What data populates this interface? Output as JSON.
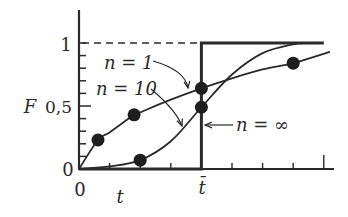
{
  "chart_data": {
    "type": "line",
    "title": "",
    "xlabel": "t",
    "ylabel": "F",
    "xlim": [
      0,
      8.3
    ],
    "ylim": [
      0,
      1.25
    ],
    "x_ticks": [
      1,
      2,
      3,
      4,
      5,
      6,
      7,
      8
    ],
    "x_tick_labels": [
      {
        "x": 0,
        "label": "0"
      },
      {
        "x": 4,
        "label": "t̄"
      }
    ],
    "y_ticks": [
      0,
      0.1,
      0.2,
      0.3,
      0.4,
      0.5,
      0.6,
      0.7,
      0.8,
      0.9,
      1.0
    ],
    "y_tick_labels": [
      {
        "y": 0,
        "label": "0"
      },
      {
        "y": 0.5,
        "label": "0,5"
      },
      {
        "y": 1,
        "label": "1"
      }
    ],
    "t_bar": 4,
    "reference_line": {
      "y": 1,
      "style": "dashed",
      "x_range": [
        0,
        4
      ]
    },
    "grid": false,
    "legend_position": "inline annotations",
    "series": [
      {
        "name": "n = 1",
        "x": [
          0,
          0.62,
          1,
          1.8,
          2,
          3,
          4,
          5,
          6,
          7,
          8.2
        ],
        "values": [
          0,
          0.23,
          0.29,
          0.43,
          0.45,
          0.55,
          0.64,
          0.72,
          0.79,
          0.84,
          0.93
        ],
        "markers": [
          {
            "x": 0.62,
            "y": 0.23
          },
          {
            "x": 1.8,
            "y": 0.43
          },
          {
            "x": 4,
            "y": 0.64
          },
          {
            "x": 7,
            "y": 0.84
          }
        ]
      },
      {
        "name": "n = 10",
        "x": [
          0,
          1,
          2,
          3,
          4,
          5,
          6,
          7,
          7.5
        ],
        "values": [
          0,
          0.02,
          0.07,
          0.22,
          0.49,
          0.75,
          0.92,
          0.99,
          1.0
        ],
        "markers": [
          {
            "x": 2,
            "y": 0.07
          },
          {
            "x": 4,
            "y": 0.49
          }
        ]
      },
      {
        "name": "n = ∞",
        "x": [
          0,
          4,
          4,
          8
        ],
        "values": [
          0,
          0,
          1,
          1
        ],
        "markers": []
      }
    ],
    "annotations": [
      {
        "text": "n = 1",
        "arrow_to": {
          "x": 3.6,
          "y": 0.62
        }
      },
      {
        "text": "n = 10",
        "arrow_to": {
          "x": 3.4,
          "y": 0.33
        }
      },
      {
        "text": "n = ∞",
        "arrow_to": {
          "x": 4,
          "y": 0.32
        }
      }
    ]
  },
  "labels": {
    "y_axis": "F",
    "x_axis": "t",
    "y_one": "1",
    "y_half": "0,5",
    "y_zero": "0",
    "x_zero": "0",
    "x_tbar": "t̄",
    "ann_n1": "n = 1",
    "ann_n10": "n = 10",
    "ann_ninf": "n = ∞"
  }
}
